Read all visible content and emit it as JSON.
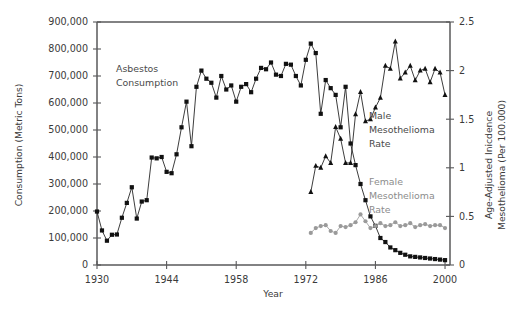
{
  "figure": {
    "title": "",
    "x_axis_title": "Year",
    "y_left_title": "Consumption (Metric Tons)",
    "y_right_title_line1": "Age-Adjusted Inicdence",
    "y_right_title_line2": "Mesothelioma (Per 100.000)"
  },
  "annotations": {
    "asbestos_line1": "Asbestos",
    "asbestos_line2": "Consumption",
    "male_line1": "Male",
    "male_line2": "Mesothelioma",
    "male_line3": "Rate",
    "female_line1": "Female",
    "female_line2": "Mesothelioma",
    "female_line3": "Rate"
  },
  "colors": {
    "consumption": "#111111",
    "male_rate": "#111111",
    "female_rate": "#9a9a9a",
    "axis": "#58585a",
    "text": "#3a3a3a"
  },
  "chart_data": {
    "type": "line",
    "title": "",
    "xlabel": "Year",
    "xlim": [
      1930,
      2001
    ],
    "x_ticks": [
      1930,
      1944,
      1958,
      1972,
      1986,
      2000
    ],
    "x_tick_labels": [
      "1930",
      "1944",
      "1958",
      "1972",
      "1986",
      "2000"
    ],
    "grid": false,
    "legend_position": "inline-annotations",
    "axes": [
      {
        "id": "left",
        "label": "Consumption (Metric Tons)",
        "lim": [
          0,
          900000
        ],
        "ticks": [
          0,
          100000,
          200000,
          300000,
          400000,
          500000,
          600000,
          700000,
          800000,
          900000
        ],
        "tick_labels": [
          "0",
          "100,000",
          "200,000",
          "300,000",
          "400,000",
          "500,000",
          "600,000",
          "700,000",
          "800,000",
          "900,000"
        ]
      },
      {
        "id": "right",
        "label": "Age-Adjusted Inicdence Mesothelioma (Per 100.000)",
        "lim": [
          0,
          2.5
        ],
        "ticks": [
          0,
          0.5,
          1,
          1.5,
          2,
          2.5
        ],
        "tick_labels": [
          "0",
          "0.5",
          "1",
          "1.5",
          "2",
          "2.5"
        ]
      }
    ],
    "series": [
      {
        "name": "Asbestos Consumption",
        "axis": "left",
        "marker": "square",
        "color": "#111111",
        "unit": "metric tons",
        "x": [
          1930,
          1931,
          1932,
          1933,
          1934,
          1935,
          1936,
          1937,
          1938,
          1939,
          1940,
          1941,
          1942,
          1943,
          1944,
          1945,
          1946,
          1947,
          1948,
          1949,
          1950,
          1951,
          1952,
          1953,
          1954,
          1955,
          1956,
          1957,
          1958,
          1959,
          1960,
          1961,
          1962,
          1963,
          1964,
          1965,
          1966,
          1967,
          1968,
          1969,
          1970,
          1971,
          1972,
          1973,
          1974,
          1975,
          1976,
          1977,
          1978,
          1979,
          1980,
          1981,
          1982,
          1983,
          1984,
          1985,
          1986,
          1987,
          1988,
          1989,
          1990,
          1991,
          1992,
          1993,
          1994,
          1995,
          1996,
          1997,
          1998,
          1999,
          2000
        ],
        "values": [
          198000,
          128000,
          90000,
          112000,
          113000,
          175000,
          230000,
          288000,
          172000,
          235000,
          240000,
          398000,
          395000,
          400000,
          345000,
          340000,
          410000,
          510000,
          605000,
          440000,
          660000,
          720000,
          690000,
          675000,
          620000,
          700000,
          650000,
          665000,
          605000,
          660000,
          670000,
          640000,
          690000,
          730000,
          725000,
          750000,
          705000,
          700000,
          745000,
          742000,
          700000,
          665000,
          760000,
          820000,
          785000,
          560000,
          685000,
          655000,
          630000,
          510000,
          660000,
          450000,
          370000,
          300000,
          240000,
          180000,
          145000,
          100000,
          85000,
          65000,
          55000,
          45000,
          38000,
          32000,
          30000,
          28000,
          26000,
          24000,
          22000,
          20000,
          18000
        ]
      },
      {
        "name": "Male Mesothelioma Rate",
        "axis": "right",
        "marker": "triangle",
        "color": "#111111",
        "unit": "per 100,000",
        "x": [
          1973,
          1974,
          1975,
          1976,
          1977,
          1978,
          1979,
          1980,
          1981,
          1982,
          1983,
          1984,
          1985,
          1986,
          1987,
          1988,
          1989,
          1990,
          1991,
          1992,
          1993,
          1994,
          1995,
          1996,
          1997,
          1998,
          1999,
          2000
        ],
        "values": [
          0.75,
          1.02,
          1.0,
          1.12,
          1.05,
          1.42,
          1.3,
          1.05,
          1.05,
          1.55,
          1.78,
          1.48,
          1.5,
          1.62,
          1.72,
          2.05,
          2.02,
          2.3,
          1.92,
          1.98,
          2.05,
          1.9,
          2.0,
          2.02,
          1.88,
          2.02,
          1.98,
          1.75
        ]
      },
      {
        "name": "Female Mesothelioma Rate",
        "axis": "right",
        "marker": "circle",
        "color": "#9a9a9a",
        "unit": "per 100,000",
        "x": [
          1973,
          1974,
          1975,
          1976,
          1977,
          1978,
          1979,
          1980,
          1981,
          1982,
          1983,
          1984,
          1985,
          1986,
          1987,
          1988,
          1989,
          1990,
          1991,
          1992,
          1993,
          1994,
          1995,
          1996,
          1997,
          1998,
          1999,
          2000
        ],
        "values": [
          0.33,
          0.38,
          0.4,
          0.41,
          0.35,
          0.33,
          0.4,
          0.39,
          0.41,
          0.44,
          0.52,
          0.45,
          0.38,
          0.4,
          0.43,
          0.4,
          0.41,
          0.44,
          0.4,
          0.41,
          0.43,
          0.39,
          0.41,
          0.42,
          0.4,
          0.41,
          0.41,
          0.38
        ]
      }
    ]
  }
}
